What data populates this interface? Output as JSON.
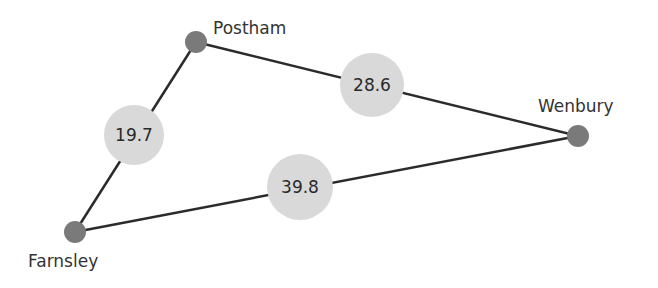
{
  "colors": {
    "edge": "#2b2b2b",
    "node": "#7a7a7a",
    "weight_bubble": "#d9d9d9",
    "text": "#333333"
  },
  "nodes": [
    {
      "id": "postham",
      "label": "Postham",
      "x": 196,
      "y": 42
    },
    {
      "id": "wenbury",
      "label": "Wenbury",
      "x": 578,
      "y": 136
    },
    {
      "id": "farnsley",
      "label": "Farnsley",
      "x": 75,
      "y": 232
    }
  ],
  "edges": [
    {
      "from": "farnsley",
      "to": "postham",
      "weight": "19.7"
    },
    {
      "from": "postham",
      "to": "wenbury",
      "weight": "28.6"
    },
    {
      "from": "farnsley",
      "to": "wenbury",
      "weight": "39.8"
    }
  ]
}
